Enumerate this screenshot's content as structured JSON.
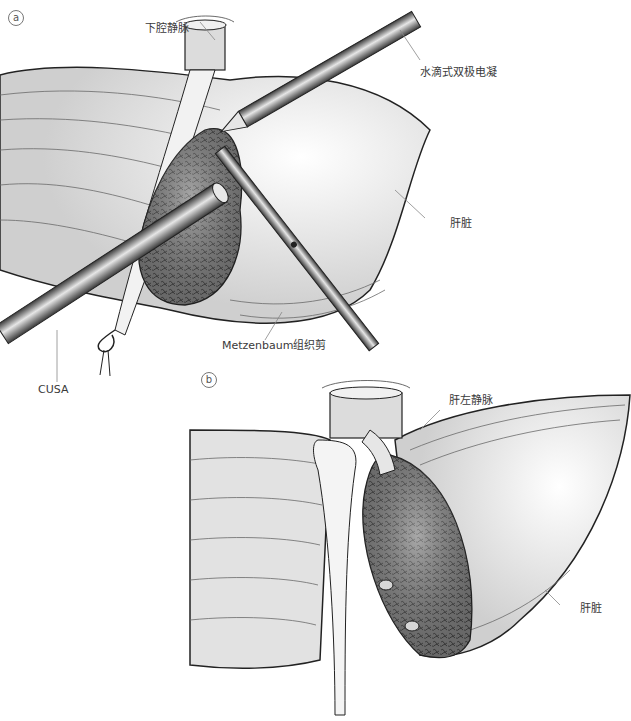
{
  "figure": {
    "panels": [
      {
        "id": "a",
        "tag": "a",
        "labels": {
          "ivc": "下腔静脉",
          "bipolar": "水滴式双极电凝",
          "liver": "肝脏",
          "scissors": "Metzenbaum组织剪",
          "cusa": "CUSA"
        }
      },
      {
        "id": "b",
        "tag": "b",
        "labels": {
          "left_hepatic_vein": "肝左静脉",
          "liver": "肝脏"
        }
      }
    ],
    "colors": {
      "liver_fill": "#e4e4e4",
      "tissue_fill": "#6e6e6e",
      "instrument_dark": "#444444",
      "instrument_light": "#d8d8d8",
      "line": "#222222",
      "leader": "#888888"
    }
  }
}
